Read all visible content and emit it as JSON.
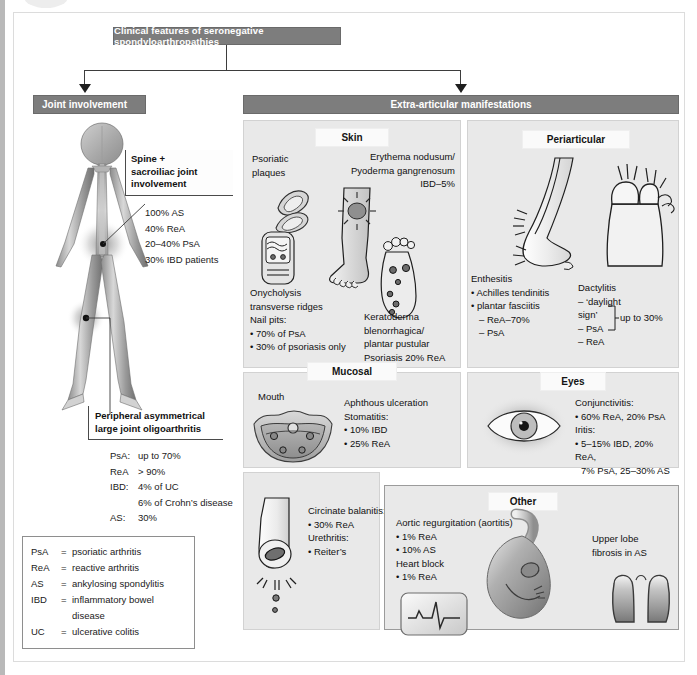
{
  "diagram": {
    "title": "Clinical features of seronegative spondyloarthropathies",
    "branches": {
      "joint": "Joint involvement",
      "extra": "Extra-articular manifestations"
    }
  },
  "joint_involvement": {
    "spine_heading": "Spine +\nsacroiliac joint\ninvolvement",
    "spine_heading_l1": "Spine +",
    "spine_heading_l2": "sacroiliac joint",
    "spine_heading_l3": "involvement",
    "spine_stats": [
      "100% AS",
      "40% ReA",
      "20–40% PsA",
      "30% IBD patients"
    ],
    "peripheral_heading_l1": "Peripheral asymmetrical",
    "peripheral_heading_l2": "large joint oligoarthritis",
    "peripheral_stats": [
      {
        "key": "PsA:",
        "value": "up to 70%"
      },
      {
        "key": "ReA",
        "value": "> 90%"
      },
      {
        "key": "IBD:",
        "value": "4% of UC"
      },
      {
        "key": "",
        "value": "6% of Crohn’s disease"
      },
      {
        "key": "AS:",
        "value": "30%"
      }
    ],
    "legend": [
      {
        "abbr": "PsA",
        "eq": "=",
        "text": "psoriatic arthritis"
      },
      {
        "abbr": "ReA",
        "eq": "=",
        "text": "reactive arthritis"
      },
      {
        "abbr": "AS",
        "eq": "=",
        "text": "ankylosing spondylitis"
      },
      {
        "abbr": "IBD",
        "eq": "=",
        "text": "inflammatory bowel disease"
      },
      {
        "abbr": "UC",
        "eq": "=",
        "text": "ulcerative colitis"
      }
    ]
  },
  "skin": {
    "title": "Skin",
    "psoriatic_plaques_l1": "Psoriatic",
    "psoriatic_plaques_l2": "plaques",
    "erythema_l1": "Erythema nodusum/",
    "erythema_l2": "Pyoderma gangrenosum",
    "erythema_l3": "IBD–5%",
    "nail_l1": "Onycholysis",
    "nail_l2": "transverse ridges",
    "nail_l3": "Nail pits:",
    "nail_l4": "• 70% of PsA",
    "nail_l5": "• 30% of psoriasis only",
    "kerato_l1": "Keratoderma",
    "kerato_l2": "blenorrhagica/",
    "kerato_l3": "plantar pustular",
    "kerato_l4": "Psoriasis 20% ReA"
  },
  "periarticular": {
    "title": "Periarticular",
    "enthesitis_l1": "Enthesitis",
    "enthesitis_l2": "• Achilles tendinitis",
    "enthesitis_l3": "• plantar fasciitis",
    "enthesitis_l4": "– ReA–70%",
    "enthesitis_l5": "– PsA",
    "dactylitis_l1": "Dactylitis",
    "dactylitis_l2": "– ‘daylight sign’",
    "dactylitis_l3": "– PsA",
    "dactylitis_l4": "– ReA",
    "dactylitis_bracket": "up to 30%"
  },
  "mucosal": {
    "title": "Mucosal",
    "mouth_label": "Mouth",
    "l1": "Aphthous ulceration",
    "l2": "Stomatitis:",
    "l3": "• 10% IBD",
    "l4": "• 25% ReA"
  },
  "eyes": {
    "title": "Eyes",
    "l1": "Conjunctivitis:",
    "l2": "• 60% ReA, 20% PsA",
    "l3": "Iritis:",
    "l4": "• 5–15% IBD, 20% ReA,",
    "l5": "7% PsA, 25–30% AS"
  },
  "urogenital": {
    "l1": "Circinate balanitis:",
    "l2": "• 30% ReA",
    "l3": "Urethritis:",
    "l4": "• Reiter’s"
  },
  "other": {
    "title": "Other",
    "l1": "Aortic regurgitation (aortitis)",
    "l2": "• 1% ReA",
    "l3": "• 10% AS",
    "l4": "Heart block",
    "l5": "• 1% ReA",
    "lung_l1": "Upper lobe",
    "lung_l2": "fibrosis in AS"
  },
  "colors": {
    "header_bar": "#7d7d7d",
    "panel_bg": "#e9e9e9",
    "panel_title_bg": "#fafafa",
    "connector": "#3d3d3d",
    "text": "#111111"
  }
}
